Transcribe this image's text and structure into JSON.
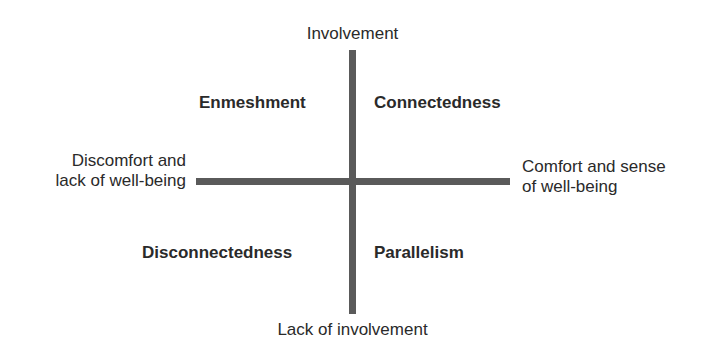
{
  "diagram": {
    "type": "quadrant",
    "axes": {
      "vertical": {
        "top_label": "Involvement",
        "bottom_label": "Lack of involvement"
      },
      "horizontal": {
        "left_label": "Discomfort and\nlack of well-being",
        "right_label": "Comfort and sense\nof well-being"
      }
    },
    "quadrants": {
      "top_left": "Enmeshment",
      "top_right": "Connectedness",
      "bottom_left": "Disconnectedness",
      "bottom_right": "Parallelism"
    },
    "colors": {
      "axis": "#5a5a5a",
      "text": "#2a2a2a",
      "background": "#ffffff"
    }
  }
}
